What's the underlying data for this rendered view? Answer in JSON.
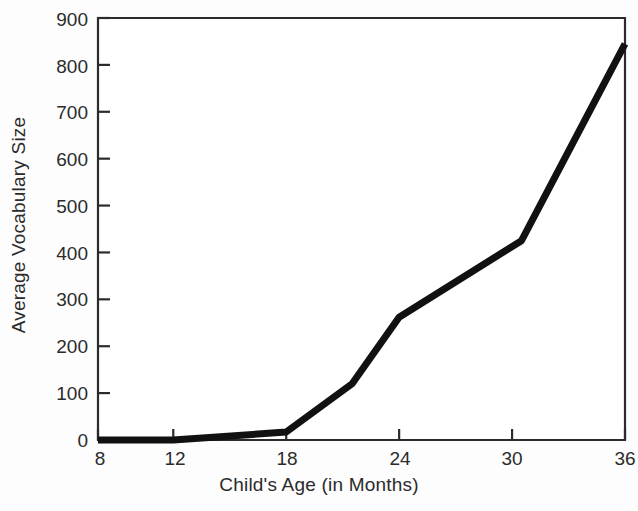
{
  "chart_data": {
    "type": "line",
    "title": "",
    "xlabel": "Child's Age (in Months)",
    "ylabel": "Average Vocabulary Size",
    "xlim": [
      8,
      36
    ],
    "ylim": [
      0,
      900
    ],
    "xticks": [
      8,
      12,
      18,
      24,
      30,
      36
    ],
    "xtick_labels": [
      "8",
      "12",
      "18",
      "24",
      "30",
      "36"
    ],
    "yticks": [
      0,
      100,
      200,
      300,
      400,
      500,
      600,
      700,
      800,
      900
    ],
    "ytick_labels": [
      "0",
      "100",
      "200",
      "300",
      "400",
      "500",
      "600",
      "700",
      "800",
      "900"
    ],
    "grid": false,
    "legend": "none",
    "series": [
      {
        "name": "Average Vocabulary Size",
        "color": "#111111",
        "line_width": 7,
        "x": [
          8,
          12,
          18,
          21.5,
          24,
          30.5,
          36
        ],
        "values": [
          0,
          0,
          17,
          120,
          262,
          425,
          845
        ]
      }
    ]
  },
  "axes": {
    "frame_color": "#2b2b2b",
    "plot_background": "#ffffff"
  }
}
